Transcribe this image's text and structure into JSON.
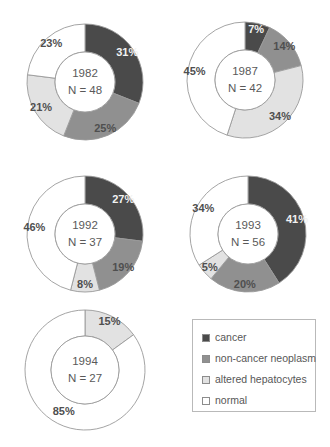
{
  "figure": {
    "background_color": "#ffffff",
    "outline_color": "#9a9a9a"
  },
  "legend": {
    "name": "category-legend",
    "items": [
      {
        "label": "cancer",
        "key": "cancer",
        "color": "#4a4a4a"
      },
      {
        "label": "non-cancer neoplasm",
        "key": "non_cancer_neoplasm",
        "color": "#909090"
      },
      {
        "label": "altered hepatocytes",
        "key": "altered_hepatocytes",
        "color": "#e2e2e2"
      },
      {
        "label": "normal",
        "key": "normal",
        "color": "#ffffff"
      }
    ]
  },
  "chart_data": [
    {
      "type": "pie",
      "title": "1982",
      "subtitle": "N = 48",
      "center_lines": [
        "1982",
        "N = 48"
      ],
      "n": 48,
      "categories": [
        "cancer",
        "non-cancer neoplasm",
        "altered hepatocytes",
        "normal"
      ],
      "values": [
        31,
        25,
        21,
        23
      ],
      "labels": [
        "31%",
        "25%",
        "21%",
        "23%"
      ],
      "colors": [
        "#4a4a4a",
        "#909090",
        "#e2e2e2",
        "#ffffff"
      ],
      "start_angle_deg": 0,
      "cx": 85,
      "cy": 82,
      "r_outer": 58,
      "r_inner": 30
    },
    {
      "type": "pie",
      "title": "1987",
      "subtitle": "N = 42",
      "center_lines": [
        "1987",
        "N = 42"
      ],
      "n": 42,
      "categories": [
        "cancer",
        "non-cancer neoplasm",
        "altered hepatocytes",
        "normal"
      ],
      "values": [
        7,
        14,
        34,
        45
      ],
      "labels": [
        "7%",
        "14%",
        "34%",
        "45%"
      ],
      "colors": [
        "#4a4a4a",
        "#909090",
        "#e2e2e2",
        "#ffffff"
      ],
      "start_angle_deg": 0,
      "cx": 245,
      "cy": 80,
      "r_outer": 58,
      "r_inner": 30
    },
    {
      "type": "pie",
      "title": "1992",
      "subtitle": "N = 37",
      "center_lines": [
        "1992",
        "N = 37"
      ],
      "n": 37,
      "categories": [
        "cancer",
        "non-cancer neoplasm",
        "altered hepatocytes",
        "normal"
      ],
      "values": [
        27,
        19,
        8,
        46
      ],
      "labels": [
        "27%",
        "19%",
        "8%",
        "46%"
      ],
      "colors": [
        "#4a4a4a",
        "#909090",
        "#e2e2e2",
        "#ffffff"
      ],
      "start_angle_deg": 0,
      "cx": 85,
      "cy": 234,
      "r_outer": 58,
      "r_inner": 30
    },
    {
      "type": "pie",
      "title": "1993",
      "subtitle": "N = 56",
      "center_lines": [
        "1993",
        "N = 56"
      ],
      "n": 56,
      "categories": [
        "cancer",
        "non-cancer neoplasm",
        "altered hepatocytes",
        "normal"
      ],
      "values": [
        41,
        20,
        5,
        34
      ],
      "labels": [
        "41%",
        "20%",
        "5%",
        "34%"
      ],
      "colors": [
        "#4a4a4a",
        "#909090",
        "#e2e2e2",
        "#ffffff"
      ],
      "start_angle_deg": 0,
      "cx": 248,
      "cy": 234,
      "r_outer": 58,
      "r_inner": 30
    },
    {
      "type": "pie",
      "title": "1994",
      "subtitle": "N = 27",
      "center_lines": [
        "1994",
        "N = 27"
      ],
      "n": 27,
      "categories": [
        "altered hepatocytes",
        "normal"
      ],
      "values": [
        15,
        85
      ],
      "labels": [
        "15%",
        "85%"
      ],
      "colors": [
        "#e2e2e2",
        "#ffffff"
      ],
      "start_angle_deg": 0,
      "cx": 85,
      "cy": 370,
      "r_outer": 60,
      "r_inner": 34
    }
  ]
}
